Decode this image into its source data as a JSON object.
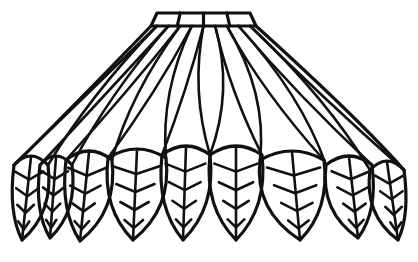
{
  "figure": {
    "title": "Lampshade leaf pattern line drawing",
    "stroke_color": "#111111",
    "background": "#ffffff",
    "top_band": {
      "x1": 157,
      "x2": 250,
      "y_top": 13,
      "y_bottom": 26,
      "cells": 4
    },
    "leaves": [
      {
        "tip_x": 22,
        "tip_y": 240,
        "base_left": 14,
        "base_right": 48,
        "base_y": 165
      },
      {
        "tip_x": 50,
        "tip_y": 238,
        "base_left": 40,
        "base_right": 72,
        "base_y": 165
      },
      {
        "tip_x": 80,
        "tip_y": 241,
        "base_left": 66,
        "base_right": 112,
        "base_y": 160
      },
      {
        "tip_x": 133,
        "tip_y": 240,
        "base_left": 108,
        "base_right": 166,
        "base_y": 158
      },
      {
        "tip_x": 183,
        "tip_y": 240,
        "base_left": 162,
        "base_right": 210,
        "base_y": 155
      },
      {
        "tip_x": 236,
        "tip_y": 240,
        "base_left": 210,
        "base_right": 262,
        "base_y": 155
      },
      {
        "tip_x": 300,
        "tip_y": 240,
        "base_left": 260,
        "base_right": 324,
        "base_y": 160
      },
      {
        "tip_x": 358,
        "tip_y": 238,
        "base_left": 326,
        "base_right": 372,
        "base_y": 165
      },
      {
        "tip_x": 398,
        "tip_y": 240,
        "base_left": 370,
        "base_right": 404,
        "base_y": 170
      }
    ]
  }
}
